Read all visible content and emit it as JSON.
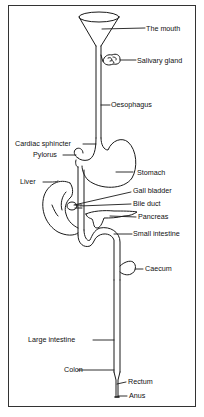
{
  "diagram": {
    "line_color": "#1a1a1a",
    "background": "#ffffff",
    "labels": {
      "mouth": "The mouth",
      "salivary_gland": "Salivary gland",
      "oesophagus": "Oesophagus",
      "cardiac_sphincter": "Cardiac sphincter",
      "pylorus": "Pylorus",
      "stomach": "Stomach",
      "liver": "Liver",
      "gall_bladder": "Gall bladder",
      "bile_duct": "Bile duct",
      "pancreas": "Pancreas",
      "small_intestine": "Small intestine",
      "caecum": "Caecum",
      "large_intestine": "Large intestine",
      "colon": "Colon",
      "rectum": "Rectum",
      "anus": "Anus"
    }
  }
}
